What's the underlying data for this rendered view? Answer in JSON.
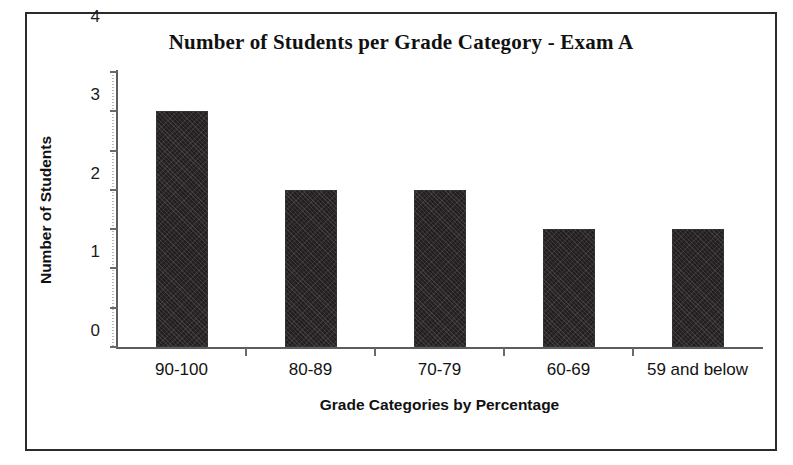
{
  "chart_data": {
    "type": "bar",
    "title": "Number of Students per Grade Category - Exam A",
    "xlabel": "Grade Categories by Percentage",
    "ylabel": "Number of Students",
    "categories": [
      "90-100",
      "80-89",
      "70-79",
      "60-69",
      "59 and below"
    ],
    "values": [
      6,
      4,
      4,
      3,
      3
    ],
    "ylim": [
      0,
      7
    ],
    "ytick_labels": [
      "0",
      "1",
      "2",
      "3",
      "4",
      "5",
      "6",
      "7"
    ],
    "ytick_values": [
      0,
      1,
      2,
      3,
      4,
      5,
      6,
      7
    ],
    "grid": false,
    "legend": false,
    "legend_position": "none",
    "series": [
      {
        "name": "Number of Students",
        "values": [
          6,
          4,
          4,
          3,
          3
        ],
        "color": "#231f20"
      }
    ],
    "annotations": [],
    "bar_color": "#231f20",
    "frame_color": "#2b2b2b",
    "background": "#ffffff"
  }
}
